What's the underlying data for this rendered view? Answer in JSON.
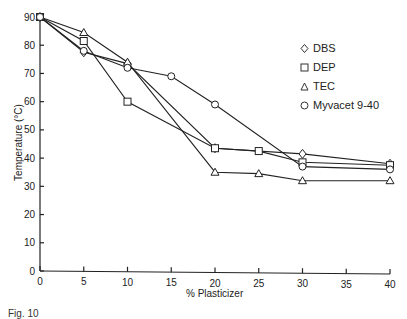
{
  "chart_data": {
    "type": "line",
    "title": "",
    "xlabel": "% Plasticizer",
    "ylabel": "Temperature (°C)",
    "xlim": [
      0,
      40
    ],
    "ylim": [
      0,
      90
    ],
    "xticks": [
      0,
      5,
      10,
      15,
      20,
      25,
      30,
      35,
      40
    ],
    "yticks": [
      0,
      10,
      20,
      30,
      40,
      50,
      60,
      70,
      80,
      90
    ],
    "grid": false,
    "legend_position": "upper right",
    "series": [
      {
        "name": "DBS",
        "marker": "diamond",
        "x": [
          0,
          5,
          10,
          20,
          30,
          40
        ],
        "y": [
          90,
          77.5,
          73.5,
          43.5,
          41.5,
          38
        ]
      },
      {
        "name": "DEP",
        "marker": "square",
        "x": [
          0,
          5,
          10,
          20,
          25,
          30,
          40
        ],
        "y": [
          90,
          81.5,
          60,
          43.5,
          42.5,
          38.5,
          37.5
        ]
      },
      {
        "name": "TEC",
        "marker": "triangle",
        "x": [
          0,
          5,
          10,
          20,
          25,
          30,
          40
        ],
        "y": [
          90,
          84.5,
          74,
          35,
          34.5,
          32,
          32
        ]
      },
      {
        "name": "Myvacet 9-40",
        "marker": "circle",
        "x": [
          0,
          5,
          10,
          15,
          20,
          30,
          40
        ],
        "y": [
          90,
          78,
          72,
          69,
          59,
          37,
          36
        ]
      }
    ]
  },
  "labels": {
    "xlabel": "% Plasticizer",
    "ylabel": "Temperature (°C)",
    "caption": "Fig. 10"
  },
  "legend": [
    {
      "name": "DBS",
      "marker": "diamond"
    },
    {
      "name": "DEP",
      "marker": "square"
    },
    {
      "name": "TEC",
      "marker": "triangle"
    },
    {
      "name": "Myvacet 9-40",
      "marker": "circle"
    }
  ]
}
